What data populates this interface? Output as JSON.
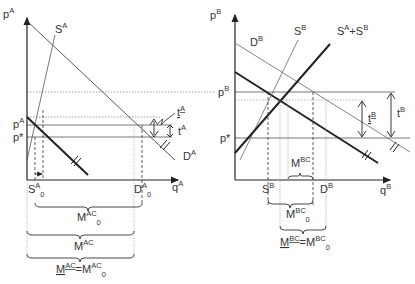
{
  "panel_a": {
    "axis_y": "p",
    "axis_y_sup": "A",
    "axis_x": "q",
    "axis_x_sup": "A",
    "supply": "S",
    "supply_sup": "A",
    "demand": "D",
    "demand_sup": "A",
    "price_local": "p",
    "price_local_sup": "A",
    "price_world": "p*",
    "tariff": "t",
    "tariff_sup": "A",
    "tariff_min": "t",
    "tariff_min_sup": "A",
    "supply_q": "S",
    "supply_q_sup": "A",
    "supply_q_sub": "0",
    "demand_q": "D",
    "demand_q_sup": "A",
    "demand_q_sub": "0",
    "imports0": "M",
    "imports0_sup": "AC",
    "imports0_sub": "0",
    "imports": "M",
    "imports_sup": "AC",
    "eq_lhs": "M",
    "eq_lhs_sup": "AC",
    "eq_eq": "=",
    "eq_rhs": "M",
    "eq_rhs_sup": "AC",
    "eq_rhs_sub": "0"
  },
  "panel_b": {
    "axis_y": "p",
    "axis_y_sup": "B",
    "axis_x": "q",
    "axis_x_sup": "B",
    "supply": "S",
    "supply_sup": "B",
    "agg_supply": "S",
    "agg_supply_sup1": "A",
    "agg_supply_plus": "+S",
    "agg_supply_sup2": "B",
    "demand": "D",
    "demand_sup": "B",
    "price_local": "p",
    "price_local_sup": "B",
    "price_world": "p*",
    "tariff": "t",
    "tariff_sup": "B",
    "tariff_min": "t",
    "tariff_min_sup": "B",
    "supply_q": "S",
    "supply_q_sup": "B",
    "demand_q": "D",
    "demand_q_sup": "B",
    "imports": "M",
    "imports_sup": "BC",
    "imports0": "M",
    "imports0_sup": "BC",
    "imports0_sub": "0",
    "eq_lhs": "M",
    "eq_lhs_sup": "BC",
    "eq_eq": "=",
    "eq_rhs": "M",
    "eq_rhs_sup": "BC",
    "eq_rhs_sub": "0"
  }
}
